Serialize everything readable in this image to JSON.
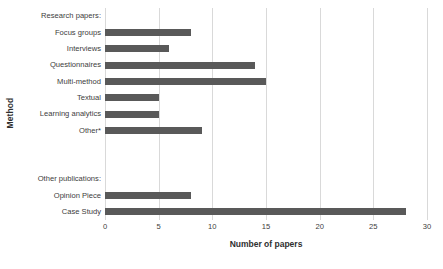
{
  "chart_data": {
    "type": "bar",
    "orientation": "horizontal",
    "title": "",
    "xlabel": "Number of papers",
    "ylabel": "Method",
    "xlim": [
      0,
      30
    ],
    "xticks": [
      0,
      5,
      10,
      15,
      20,
      25,
      30
    ],
    "grid": "vertical",
    "legend": "none",
    "bar_color": "#595959",
    "gridline_color": "#d9d9d9",
    "background_color": "#ffffff",
    "categories": [
      "Research papers:",
      "Focus groups",
      "Interviews",
      "Questionnaires",
      "Multi-method",
      "Textual",
      "Learning analytics",
      "Other*",
      "",
      "",
      "Other publications:",
      "Opinion Piece",
      "Case Study"
    ],
    "values": [
      null,
      8,
      6,
      14,
      15,
      5,
      5,
      9,
      null,
      null,
      null,
      8,
      28
    ],
    "rows": [
      {
        "label": "Research papers:",
        "value": null,
        "kind": "header"
      },
      {
        "label": "Focus groups",
        "value": 8,
        "kind": "bar"
      },
      {
        "label": "Interviews",
        "value": 6,
        "kind": "bar"
      },
      {
        "label": "Questionnaires",
        "value": 14,
        "kind": "bar"
      },
      {
        "label": "Multi-method",
        "value": 15,
        "kind": "bar"
      },
      {
        "label": "Textual",
        "value": 5,
        "kind": "bar"
      },
      {
        "label": "Learning analytics",
        "value": 5,
        "kind": "bar"
      },
      {
        "label": "Other*",
        "value": 9,
        "kind": "bar"
      },
      {
        "label": "",
        "value": null,
        "kind": "blank"
      },
      {
        "label": "",
        "value": null,
        "kind": "blank"
      },
      {
        "label": "Other publications:",
        "value": null,
        "kind": "header"
      },
      {
        "label": "Opinion Piece",
        "value": 8,
        "kind": "bar"
      },
      {
        "label": "Case Study",
        "value": 28,
        "kind": "bar"
      }
    ]
  }
}
